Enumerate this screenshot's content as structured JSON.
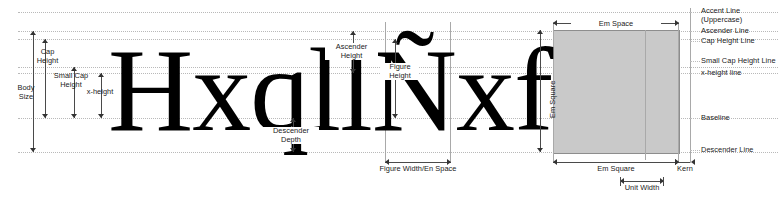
{
  "diagram": {
    "specimen_text": "HxqllÑxf",
    "glyphs": [
      "H",
      "x",
      "q",
      "l",
      "l",
      "Ñ",
      "x",
      "f"
    ],
    "colors": {
      "em_square_fill": "#c9c9c9",
      "em_square_stroke": "#8d8d8d",
      "guide_line": "#b9b9b9",
      "arrow": "#333333",
      "text": "#1a1a1a",
      "muted_text": "#8a8a8a",
      "background": "#ffffff"
    }
  },
  "left_measures": [
    {
      "id": "body-size",
      "label": "Body\nSize",
      "line1": "Body",
      "line2": "Size"
    },
    {
      "id": "cap-height",
      "label": "Cap\nHeight",
      "line1": "Cap",
      "line2": "Height"
    },
    {
      "id": "small-cap-height",
      "label": "Small Cap\nHeight",
      "line1": "Small Cap",
      "line2": "Height"
    },
    {
      "id": "x-height",
      "label": "x-height",
      "line1": "x-height",
      "line2": ""
    }
  ],
  "middle_measures": [
    {
      "id": "descender-depth",
      "line1": "Descender",
      "line2": "Depth"
    },
    {
      "id": "ascender-height",
      "line1": "Ascender",
      "line2": "Height"
    },
    {
      "id": "figure-height",
      "line1": "Figure",
      "line2": "Height"
    }
  ],
  "bottom_measures": [
    {
      "id": "figure-width-en-space",
      "label": "Figure Width/En Space"
    },
    {
      "id": "em-square",
      "label": "Em Square"
    },
    {
      "id": "kern",
      "label": "Kern"
    },
    {
      "id": "unit-width",
      "label": "Unit  Width"
    }
  ],
  "top_measures": [
    {
      "id": "em-space",
      "label": "Em Space"
    }
  ],
  "vertical_labels": [
    {
      "id": "em-square-vertical",
      "label": "Em Square"
    }
  ],
  "right_labels": [
    {
      "id": "accent-line",
      "label": "Accent Line",
      "sub": "(Uppercase)"
    },
    {
      "id": "ascender-line",
      "label": "Ascender Line",
      "sub": ""
    },
    {
      "id": "cap-height-line",
      "label": "Cap Height Line",
      "sub": ""
    },
    {
      "id": "small-cap-height-line",
      "label": "Small Cap Height Line",
      "sub": ""
    },
    {
      "id": "x-height-line",
      "label": "x-height line",
      "sub": ""
    },
    {
      "id": "baseline",
      "label": "Baseline",
      "sub": ""
    },
    {
      "id": "descender-line",
      "label": "Descender Line",
      "sub": ""
    }
  ]
}
